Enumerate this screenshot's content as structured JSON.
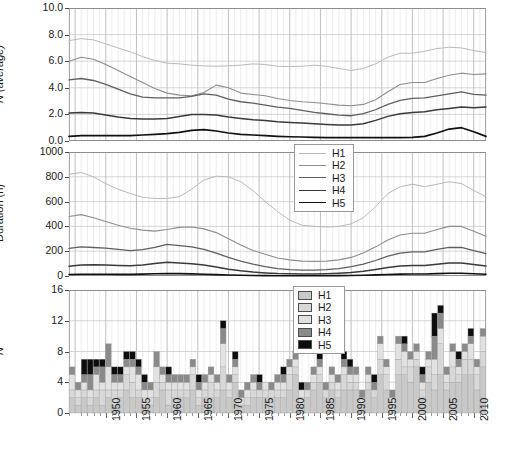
{
  "figure": {
    "width": 505,
    "height": 461,
    "background": "#ffffff"
  },
  "series_meta": {
    "names": [
      "H1",
      "H2",
      "H3",
      "H4",
      "H5"
    ],
    "line_colors": [
      "#b9b9b9",
      "#8e8e8e",
      "#5f5f5f",
      "#3a3a3a",
      "#111111"
    ],
    "line_widths": [
      1.0,
      1.1,
      1.3,
      1.5,
      1.7
    ],
    "fill_colors": [
      "#c9c9c9",
      "#d8d8d8",
      "#e2e2e2",
      "#8a8a8a",
      "#0d0d0d"
    ]
  },
  "axis": {
    "x_start": 1944,
    "x_end": 2012,
    "x_tick_labels": [
      "1950",
      "1955",
      "1960",
      "1965",
      "1970",
      "1975",
      "1980",
      "1985",
      "1990",
      "1995",
      "2000",
      "2005",
      "2010"
    ],
    "x_tick_values": [
      1950,
      1955,
      1960,
      1965,
      1970,
      1975,
      1980,
      1985,
      1990,
      1995,
      2000,
      2005,
      2010
    ]
  },
  "legends": {
    "lines": {
      "name": "line-legend",
      "entries": [
        "H1",
        "H2",
        "H3",
        "H4",
        "H5"
      ]
    },
    "bars": {
      "name": "bar-legend",
      "entries": [
        "H1",
        "H2",
        "H3",
        "H4",
        "H5"
      ]
    }
  },
  "chart_data": [
    {
      "type": "line",
      "panel": "top",
      "title": "",
      "xlabel": "",
      "ylabel": "N (average)",
      "ylim": [
        0.0,
        10.0
      ],
      "xlim": [
        1944,
        2012
      ],
      "grid": true,
      "legend_position": "outside-lower-right",
      "ytick_labels": [
        "0.0",
        "2.0",
        "4.0",
        "6.0",
        "8.0",
        "10.0"
      ],
      "ytick_values": [
        0,
        2,
        4,
        6,
        8,
        10
      ],
      "x": [
        1944,
        1946,
        1948,
        1950,
        1952,
        1954,
        1956,
        1958,
        1960,
        1962,
        1964,
        1966,
        1968,
        1970,
        1972,
        1974,
        1976,
        1978,
        1980,
        1982,
        1984,
        1986,
        1988,
        1990,
        1992,
        1994,
        1996,
        1998,
        2000,
        2002,
        2004,
        2006,
        2008,
        2010,
        2012
      ],
      "series": [
        {
          "name": "H1",
          "values": [
            7.55,
            7.7,
            7.6,
            7.3,
            7.0,
            6.7,
            6.35,
            6.05,
            5.85,
            5.8,
            5.7,
            5.65,
            5.62,
            5.65,
            5.7,
            5.8,
            5.75,
            5.62,
            5.6,
            5.62,
            5.7,
            5.62,
            5.45,
            5.3,
            5.45,
            5.8,
            6.3,
            6.6,
            6.6,
            6.75,
            6.95,
            7.05,
            7.0,
            6.8,
            6.65
          ]
        },
        {
          "name": "H2",
          "values": [
            6.0,
            6.3,
            6.15,
            5.75,
            5.3,
            4.85,
            4.4,
            3.95,
            3.6,
            3.45,
            3.4,
            3.65,
            4.2,
            4.0,
            3.6,
            3.5,
            3.4,
            3.2,
            3.05,
            2.95,
            2.9,
            2.8,
            2.7,
            2.65,
            2.75,
            3.1,
            3.7,
            4.25,
            4.4,
            4.4,
            4.7,
            4.95,
            5.1,
            5.0,
            5.05
          ]
        },
        {
          "name": "H3",
          "values": [
            4.6,
            4.7,
            4.55,
            4.25,
            3.9,
            3.55,
            3.3,
            3.25,
            3.25,
            3.25,
            3.35,
            3.55,
            3.45,
            3.15,
            2.95,
            2.85,
            2.7,
            2.55,
            2.45,
            2.3,
            2.15,
            2.05,
            1.95,
            1.9,
            2.05,
            2.35,
            2.75,
            3.05,
            3.2,
            3.25,
            3.4,
            3.55,
            3.7,
            3.5,
            3.45
          ]
        },
        {
          "name": "H4",
          "values": [
            2.1,
            2.15,
            2.1,
            1.95,
            1.8,
            1.7,
            1.65,
            1.65,
            1.7,
            1.85,
            2.0,
            2.0,
            1.95,
            1.8,
            1.7,
            1.6,
            1.55,
            1.45,
            1.4,
            1.35,
            1.3,
            1.25,
            1.2,
            1.2,
            1.3,
            1.55,
            1.85,
            2.05,
            2.15,
            2.2,
            2.35,
            2.45,
            2.55,
            2.5,
            2.55
          ]
        },
        {
          "name": "H5",
          "values": [
            0.35,
            0.4,
            0.4,
            0.4,
            0.4,
            0.4,
            0.45,
            0.5,
            0.55,
            0.65,
            0.8,
            0.85,
            0.75,
            0.6,
            0.5,
            0.45,
            0.4,
            0.35,
            0.32,
            0.3,
            0.28,
            0.25,
            0.25,
            0.25,
            0.25,
            0.25,
            0.25,
            0.25,
            0.28,
            0.35,
            0.6,
            0.9,
            1.0,
            0.7,
            0.35
          ]
        }
      ]
    },
    {
      "type": "line",
      "panel": "middle",
      "title": "",
      "xlabel": "",
      "ylabel": "Duration (h)",
      "ylim": [
        0,
        1000
      ],
      "xlim": [
        1944,
        2012
      ],
      "grid": true,
      "legend_position": "upper-right-of-top-panel",
      "ytick_labels": [
        "0",
        "200",
        "400",
        "600",
        "800",
        "1000"
      ],
      "ytick_values": [
        0,
        200,
        400,
        600,
        800,
        1000
      ],
      "x": [
        1944,
        1946,
        1948,
        1950,
        1952,
        1954,
        1956,
        1958,
        1960,
        1962,
        1964,
        1966,
        1968,
        1970,
        1972,
        1974,
        1976,
        1978,
        1980,
        1982,
        1984,
        1986,
        1988,
        1990,
        1992,
        1994,
        1996,
        1998,
        2000,
        2002,
        2004,
        2006,
        2008,
        2010,
        2012
      ],
      "series": [
        {
          "name": "H1",
          "values": [
            820,
            835,
            800,
            745,
            700,
            665,
            635,
            625,
            625,
            640,
            700,
            775,
            805,
            800,
            760,
            690,
            600,
            520,
            450,
            410,
            400,
            395,
            400,
            420,
            470,
            560,
            665,
            720,
            740,
            720,
            740,
            760,
            745,
            690,
            640
          ]
        },
        {
          "name": "H2",
          "values": [
            480,
            495,
            470,
            440,
            410,
            385,
            370,
            362,
            375,
            392,
            395,
            380,
            350,
            300,
            250,
            205,
            175,
            145,
            130,
            120,
            118,
            120,
            130,
            150,
            185,
            235,
            290,
            330,
            345,
            345,
            375,
            400,
            400,
            360,
            320
          ]
        },
        {
          "name": "H3",
          "values": [
            222,
            235,
            230,
            225,
            215,
            205,
            212,
            230,
            255,
            245,
            235,
            215,
            185,
            150,
            120,
            95,
            75,
            60,
            52,
            48,
            48,
            52,
            60,
            75,
            95,
            125,
            160,
            185,
            195,
            195,
            215,
            230,
            230,
            205,
            180
          ]
        },
        {
          "name": "H4",
          "values": [
            78,
            88,
            90,
            88,
            85,
            82,
            88,
            100,
            110,
            105,
            98,
            88,
            72,
            55,
            42,
            32,
            25,
            20,
            18,
            16,
            16,
            18,
            22,
            28,
            38,
            52,
            68,
            80,
            85,
            85,
            95,
            105,
            105,
            92,
            80
          ]
        },
        {
          "name": "H5",
          "values": [
            12,
            14,
            14,
            14,
            13,
            13,
            15,
            18,
            20,
            19,
            17,
            14,
            11,
            8,
            6,
            4,
            3,
            2,
            2,
            2,
            2,
            2,
            3,
            4,
            6,
            9,
            12,
            15,
            16,
            16,
            19,
            22,
            22,
            18,
            14
          ]
        }
      ]
    },
    {
      "type": "bar",
      "panel": "bottom",
      "subtype": "stacked",
      "title": "",
      "xlabel": "",
      "ylabel": "N",
      "ylim": [
        0,
        16
      ],
      "grid": true,
      "legend_position": "upper-center-right",
      "ytick_labels": [
        "0",
        "4",
        "8",
        "12",
        "16"
      ],
      "ytick_values": [
        0,
        4,
        8,
        12,
        16
      ],
      "categories": [
        1944,
        1945,
        1946,
        1947,
        1948,
        1949,
        1950,
        1951,
        1952,
        1953,
        1954,
        1955,
        1956,
        1957,
        1958,
        1959,
        1960,
        1961,
        1962,
        1963,
        1964,
        1965,
        1966,
        1967,
        1968,
        1969,
        1970,
        1971,
        1972,
        1973,
        1974,
        1975,
        1976,
        1977,
        1978,
        1979,
        1980,
        1981,
        1982,
        1983,
        1984,
        1985,
        1986,
        1987,
        1988,
        1989,
        1990,
        1991,
        1992,
        1993,
        1994,
        1995,
        1996,
        1997,
        1998,
        1999,
        2000,
        2001,
        2002,
        2003,
        2004,
        2005,
        2006,
        2007,
        2008,
        2009,
        2010,
        2011,
        2012
      ],
      "series": [
        {
          "name": "H1",
          "values": [
            2,
            1,
            2,
            1,
            2,
            1,
            2,
            1,
            2,
            3,
            2,
            2,
            1,
            1,
            2,
            3,
            1,
            2,
            2,
            2,
            3,
            1,
            2,
            2,
            2,
            3,
            2,
            4,
            1,
            1,
            2,
            2,
            2,
            2,
            2,
            2,
            3,
            5,
            1,
            2,
            3,
            4,
            2,
            3,
            2,
            3,
            3,
            3,
            1,
            3,
            2,
            5,
            3,
            1,
            5,
            5,
            4,
            6,
            2,
            4,
            3,
            5,
            3,
            4,
            4,
            5,
            5,
            3,
            6
          ]
        },
        {
          "name": "H2",
          "values": [
            1,
            1,
            1,
            1,
            1,
            2,
            1,
            2,
            1,
            2,
            2,
            1,
            1,
            1,
            2,
            1,
            2,
            1,
            1,
            1,
            2,
            1,
            1,
            2,
            1,
            3,
            1,
            1,
            1,
            1,
            1,
            1,
            1,
            1,
            1,
            1,
            2,
            1,
            1,
            1,
            1,
            1,
            1,
            1,
            1,
            2,
            1,
            1,
            1,
            1,
            1,
            2,
            2,
            1,
            2,
            1,
            2,
            1,
            1,
            2,
            2,
            4,
            1,
            2,
            1,
            2,
            2,
            2,
            2
          ]
        },
        {
          "name": "H3",
          "values": [
            2,
            1,
            1,
            1,
            2,
            1,
            3,
            1,
            1,
            1,
            2,
            2,
            1,
            1,
            2,
            1,
            1,
            1,
            1,
            1,
            1,
            1,
            1,
            1,
            1,
            3,
            1,
            1,
            0,
            1,
            1,
            0,
            1,
            0,
            1,
            1,
            1,
            1,
            1,
            0,
            1,
            1,
            0,
            1,
            1,
            1,
            1,
            1,
            0,
            1,
            0,
            2,
            1,
            0,
            2,
            2,
            1,
            1,
            1,
            1,
            2,
            2,
            1,
            2,
            1,
            1,
            2,
            1,
            2
          ]
        },
        {
          "name": "H4",
          "values": [
            1,
            1,
            1,
            2,
            1,
            2,
            3,
            1,
            1,
            1,
            1,
            1,
            1,
            1,
            2,
            1,
            1,
            1,
            1,
            1,
            1,
            1,
            1,
            1,
            1,
            2,
            1,
            1,
            1,
            1,
            1,
            1,
            0,
            1,
            1,
            1,
            1,
            1,
            0,
            1,
            1,
            1,
            1,
            1,
            1,
            1,
            1,
            1,
            1,
            1,
            1,
            1,
            1,
            1,
            1,
            1,
            1,
            1,
            1,
            1,
            3,
            2,
            1,
            1,
            1,
            1,
            1,
            1,
            1
          ]
        },
        {
          "name": "H5",
          "values": [
            0,
            0,
            2,
            2,
            1,
            1,
            0,
            1,
            1,
            1,
            1,
            1,
            1,
            0,
            0,
            0,
            1,
            0,
            0,
            0,
            0,
            1,
            0,
            0,
            0,
            1,
            0,
            1,
            0,
            0,
            0,
            1,
            0,
            0,
            0,
            1,
            0,
            0,
            1,
            0,
            0,
            1,
            0,
            0,
            0,
            1,
            1,
            0,
            0,
            0,
            1,
            0,
            0,
            0,
            0,
            1,
            0,
            0,
            1,
            0,
            3,
            1,
            0,
            0,
            1,
            0,
            1,
            0,
            0
          ]
        }
      ]
    }
  ]
}
